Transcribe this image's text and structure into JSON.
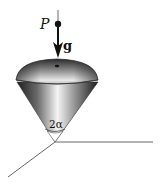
{
  "diagram": {
    "labels": {
      "point": "P",
      "gravity": "g",
      "angle": "2α"
    },
    "colors": {
      "line": "#555555",
      "cone_dark": "#2a2a2a",
      "cone_light": "#f2f2f2",
      "text": "#111111"
    }
  }
}
